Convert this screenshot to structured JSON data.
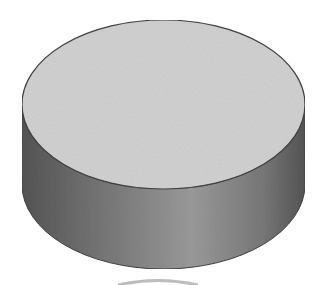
{
  "figure": {
    "shape": "3d-cylinder-disc",
    "canvas": {
      "width": 329,
      "height": 285
    },
    "colors": {
      "background": "#ffffff",
      "top_face": "#d3d3d3",
      "side_dark": "#565656",
      "side_mid": "#9c9c9c",
      "outline": "#444444",
      "reflection": "#bdbdbd"
    },
    "geometry": {
      "center_x": 163.5,
      "top_center_y": 104.5,
      "bottom_center_y": 184.5,
      "radius_x": 141.5,
      "radius_y": 84.5
    }
  }
}
